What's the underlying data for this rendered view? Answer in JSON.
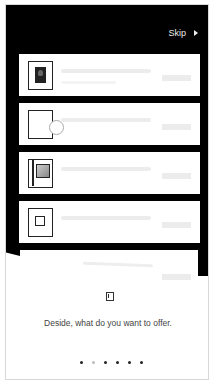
{
  "header": {
    "skip_label": "Skip",
    "skip_icon": "play-triangle-icon"
  },
  "cards": [
    {
      "thumb": "portrait-photo-thumbnail"
    },
    {
      "thumb": "empty-frame-thumbnail"
    },
    {
      "thumb": "framed-print-thumbnail"
    },
    {
      "thumb": "nested-square-thumbnail"
    }
  ],
  "footer": {
    "icon": "frame-icon",
    "message": "Deside, what do you want to offer.",
    "page_count": 6,
    "active_page": 2
  },
  "colors": {
    "background_dark": "#000000",
    "card": "#ffffff",
    "placeholder": "#ececec",
    "text": "#444444"
  }
}
